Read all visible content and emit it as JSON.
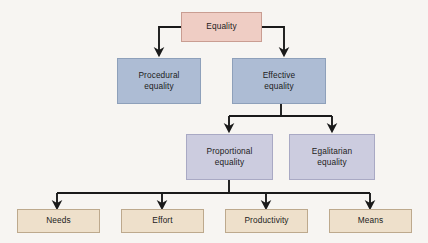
{
  "diagram": {
    "background_color": "#f7f5f2",
    "connector_color": "#1a1a1a",
    "palette": {
      "root": "#efcdc4",
      "level2": "#adbcd4",
      "level3": "#ccccdf",
      "leaf": "#eee0cb"
    },
    "nodes": {
      "root": {
        "label": "Equality",
        "color": "#efcdc4"
      },
      "procedural": {
        "label": "Procedural\nequality",
        "color": "#adbcd4"
      },
      "effective": {
        "label": "Effective\nequality",
        "color": "#adbcd4"
      },
      "proportional": {
        "label": "Proportional\nequality",
        "color": "#ccccdf"
      },
      "egalitarian": {
        "label": "Egalitarian\nequality",
        "color": "#ccccdf"
      },
      "needs": {
        "label": "Needs",
        "color": "#eee0cb"
      },
      "effort": {
        "label": "Effort",
        "color": "#eee0cb"
      },
      "productivity": {
        "label": "Productivity",
        "color": "#eee0cb"
      },
      "means": {
        "label": "Means",
        "color": "#eee0cb"
      }
    },
    "edges": [
      {
        "from": "root",
        "to": "procedural"
      },
      {
        "from": "root",
        "to": "effective"
      },
      {
        "from": "effective",
        "to": "proportional"
      },
      {
        "from": "effective",
        "to": "egalitarian"
      },
      {
        "from": "proportional",
        "to": "needs"
      },
      {
        "from": "proportional",
        "to": "effort"
      },
      {
        "from": "proportional",
        "to": "productivity"
      },
      {
        "from": "proportional",
        "to": "means"
      }
    ]
  }
}
